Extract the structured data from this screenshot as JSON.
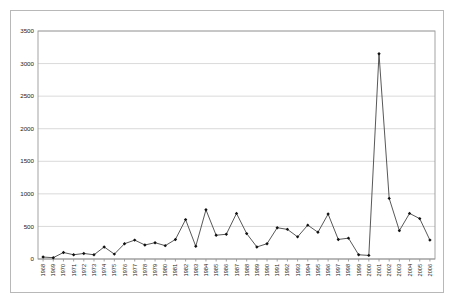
{
  "chart_data": {
    "type": "line",
    "title": "",
    "subtitle": "",
    "xlabel": "",
    "ylabel": "",
    "ylim": [
      0,
      3500
    ],
    "ytick_step": 500,
    "grid": true,
    "legend": "none",
    "marker": "filled-diamond",
    "line_color": "#3a3a3a",
    "marker_color": "#111111",
    "grid_color": "#c9c9c9",
    "border_color": "#9a9a9a",
    "yticks": [
      0,
      500,
      1000,
      1500,
      2000,
      2500,
      3000,
      3500
    ],
    "ytick_labels": [
      "0",
      "500",
      "1000",
      "1500",
      "2000",
      "2500",
      "3000",
      "3500"
    ],
    "categories": [
      "1968",
      "1969",
      "1970",
      "1971",
      "1972",
      "1973",
      "1974",
      "1975",
      "1976",
      "1977",
      "1978",
      "1979",
      "1980",
      "1981",
      "1982",
      "1983",
      "1984",
      "1985",
      "1986",
      "1987",
      "1988",
      "1989",
      "1990",
      "1991",
      "1992",
      "1993",
      "1994",
      "1995",
      "1996",
      "1997",
      "1998",
      "1999",
      "2000",
      "2001",
      "2002",
      "2003",
      "2004",
      "2005",
      "2006"
    ],
    "series": [
      {
        "name": "series-1",
        "values": [
          30,
          20,
          100,
          65,
          85,
          65,
          185,
          75,
          235,
          290,
          215,
          250,
          205,
          300,
          605,
          195,
          755,
          365,
          380,
          700,
          390,
          185,
          235,
          480,
          455,
          340,
          520,
          410,
          690,
          300,
          320,
          65,
          55,
          3150,
          930,
          435,
          700,
          620,
          290
        ]
      }
    ]
  }
}
